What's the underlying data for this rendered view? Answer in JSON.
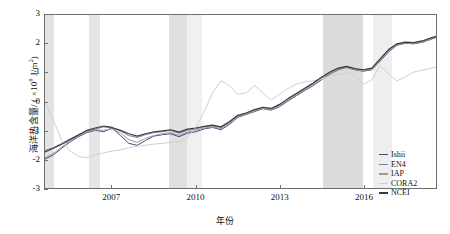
{
  "chart_data": {
    "type": "line",
    "title": "",
    "xlabel": "年份",
    "ylabel": "海洋热含量/ ( ×10⁹ J/m²)",
    "ylabel_prefix": "海洋热含量/ ( ×10",
    "ylabel_exp": "9",
    "ylabel_suffix": " J/m",
    "ylabel_exp2": "2",
    "ylabel_close": ")",
    "xlim": [
      2004.6,
      2018.6
    ],
    "ylim": [
      -3,
      3
    ],
    "grid": false,
    "legend_position": "bottom-right",
    "xticks": [
      "2007",
      "2010",
      "2013",
      "2016"
    ],
    "xtick_values": [
      2007,
      2010,
      2013,
      2016
    ],
    "yticks": [
      "3",
      "2",
      "1",
      "0",
      "-1",
      "-2",
      "-3"
    ],
    "ytick_values": [
      3,
      2,
      1,
      0,
      -1,
      -2,
      -3
    ],
    "shaded_bands": [
      {
        "x0": 2004.6,
        "x1": 2004.92,
        "color": "#e3e3e3"
      },
      {
        "x0": 2006.18,
        "x1": 2006.55,
        "color": "#e6e6e6"
      },
      {
        "x0": 2009.0,
        "x1": 2009.65,
        "color": "#e0e0e0"
      },
      {
        "x0": 2009.65,
        "x1": 2010.2,
        "color": "#f0f0f0"
      },
      {
        "x0": 2014.5,
        "x1": 2015.93,
        "color": "#dcdcdc"
      },
      {
        "x0": 2016.3,
        "x1": 2016.95,
        "color": "#eeeeee"
      }
    ],
    "series": [
      {
        "name": "Ishii",
        "color": "#4a4a78",
        "width": 1.0,
        "x": [
          2004.6,
          2004.9,
          2005.2,
          2005.5,
          2005.8,
          2006.1,
          2006.4,
          2006.7,
          2007.0,
          2007.3,
          2007.6,
          2007.9,
          2008.2,
          2008.5,
          2008.8,
          2009.1,
          2009.4,
          2009.7,
          2010.0,
          2010.3,
          2010.6,
          2010.9,
          2011.2,
          2011.5,
          2011.8,
          2012.1,
          2012.4,
          2012.7,
          2013.0,
          2013.3,
          2013.6,
          2013.9,
          2014.2,
          2014.5,
          2014.8,
          2015.1,
          2015.4,
          2015.7,
          2016.0,
          2016.3,
          2016.6,
          2016.9,
          2017.2,
          2017.5,
          2017.8,
          2018.1,
          2018.4,
          2018.6
        ],
        "y": [
          -2.0,
          -1.85,
          -1.62,
          -1.4,
          -1.22,
          -1.08,
          -1.0,
          -1.05,
          -0.92,
          -1.18,
          -1.45,
          -1.52,
          -1.35,
          -1.2,
          -1.15,
          -1.12,
          -1.22,
          -1.1,
          -1.05,
          -0.95,
          -0.9,
          -0.98,
          -0.8,
          -0.55,
          -0.45,
          -0.35,
          -0.25,
          -0.3,
          -0.18,
          0.02,
          0.2,
          0.38,
          0.55,
          0.75,
          0.95,
          1.1,
          1.18,
          1.1,
          1.05,
          1.1,
          1.4,
          1.72,
          1.95,
          2.02,
          2.0,
          2.05,
          2.15,
          2.22
        ]
      },
      {
        "name": "EN4",
        "color": "#7a7aa8",
        "width": 1.0,
        "x": [
          2004.6,
          2004.9,
          2005.2,
          2005.5,
          2005.8,
          2006.1,
          2006.4,
          2006.7,
          2007.0,
          2007.3,
          2007.6,
          2007.9,
          2008.2,
          2008.5,
          2008.8,
          2009.1,
          2009.4,
          2009.7,
          2010.0,
          2010.3,
          2010.6,
          2010.9,
          2011.2,
          2011.5,
          2011.8,
          2012.1,
          2012.4,
          2012.7,
          2013.0,
          2013.3,
          2013.6,
          2013.9,
          2014.2,
          2014.5,
          2014.8,
          2015.1,
          2015.4,
          2015.7,
          2016.0,
          2016.3,
          2016.6,
          2016.9,
          2017.2,
          2017.5,
          2017.8,
          2018.1,
          2018.4,
          2018.6
        ],
        "y": [
          -1.7,
          -1.6,
          -1.45,
          -1.3,
          -1.15,
          -1.02,
          -0.95,
          -0.88,
          -0.92,
          -1.02,
          -1.18,
          -1.25,
          -1.15,
          -1.08,
          -1.05,
          -1.0,
          -1.1,
          -1.0,
          -0.95,
          -0.88,
          -0.85,
          -0.9,
          -0.72,
          -0.5,
          -0.42,
          -0.3,
          -0.22,
          -0.25,
          -0.12,
          0.08,
          0.26,
          0.44,
          0.62,
          0.82,
          1.0,
          1.14,
          1.2,
          1.12,
          1.08,
          1.14,
          1.45,
          1.78,
          1.98,
          2.05,
          2.02,
          2.08,
          2.18,
          2.25
        ]
      },
      {
        "name": "IAP",
        "color": "#9a9a9a",
        "width": 1.0,
        "x": [
          2004.6,
          2004.9,
          2005.2,
          2005.5,
          2005.8,
          2006.1,
          2006.4,
          2006.7,
          2007.0,
          2007.3,
          2007.6,
          2007.9,
          2008.2,
          2008.5,
          2008.8,
          2009.1,
          2009.4,
          2009.7,
          2010.0,
          2010.3,
          2010.6,
          2010.9,
          2011.2,
          2011.5,
          2011.8,
          2012.1,
          2012.4,
          2012.7,
          2013.0,
          2013.3,
          2013.6,
          2013.9,
          2014.2,
          2014.5,
          2014.8,
          2015.1,
          2015.4,
          2015.7,
          2016.0,
          2016.3,
          2016.6,
          2016.9,
          2017.2,
          2017.5,
          2017.8,
          2018.1,
          2018.4,
          2018.6
        ],
        "y": [
          -1.95,
          -1.8,
          -1.58,
          -1.35,
          -1.18,
          -1.05,
          -0.98,
          -1.0,
          -0.95,
          -1.1,
          -1.32,
          -1.42,
          -1.28,
          -1.18,
          -1.12,
          -1.08,
          -1.18,
          -1.06,
          -1.0,
          -0.92,
          -0.88,
          -0.94,
          -0.76,
          -0.52,
          -0.44,
          -0.32,
          -0.24,
          -0.28,
          -0.15,
          0.05,
          0.23,
          0.41,
          0.58,
          0.78,
          0.97,
          1.12,
          1.19,
          1.11,
          1.06,
          1.12,
          1.42,
          1.75,
          1.96,
          2.03,
          2.01,
          2.06,
          2.16,
          2.23
        ]
      },
      {
        "name": "CORA2",
        "color": "#cfcfcf",
        "width": 1.0,
        "x": [
          2004.6,
          2004.9,
          2005.2,
          2005.5,
          2005.8,
          2006.1,
          2006.4,
          2006.7,
          2007.0,
          2007.3,
          2007.6,
          2007.9,
          2008.2,
          2008.5,
          2008.8,
          2009.1,
          2009.4,
          2009.7,
          2010.0,
          2010.3,
          2010.6,
          2010.9,
          2011.2,
          2011.5,
          2011.8,
          2012.1,
          2012.4,
          2012.7,
          2013.0,
          2013.3,
          2013.6,
          2013.9,
          2014.2,
          2014.5,
          2014.8,
          2015.1,
          2015.4,
          2015.7,
          2016.0,
          2016.3,
          2016.6,
          2016.9,
          2017.2,
          2017.5,
          2017.8,
          2018.1,
          2018.4,
          2018.6
        ],
        "y": [
          -0.05,
          -0.65,
          -1.35,
          -1.72,
          -1.9,
          -1.95,
          -1.85,
          -1.78,
          -1.72,
          -1.68,
          -1.6,
          -1.55,
          -1.52,
          -1.48,
          -1.45,
          -1.42,
          -1.38,
          -1.25,
          -0.9,
          -0.35,
          0.3,
          0.72,
          0.55,
          0.25,
          0.3,
          0.55,
          0.3,
          0.05,
          0.25,
          0.45,
          0.6,
          0.68,
          0.72,
          0.78,
          0.88,
          0.95,
          1.0,
          0.9,
          0.6,
          0.75,
          1.25,
          0.95,
          0.72,
          0.85,
          1.02,
          1.08,
          1.15,
          1.2
        ]
      },
      {
        "name": "NCEI",
        "color": "#3c3c3c",
        "width": 1.2,
        "x": [
          2004.6,
          2004.9,
          2005.2,
          2005.5,
          2005.8,
          2006.1,
          2006.4,
          2006.7,
          2007.0,
          2007.3,
          2007.6,
          2007.9,
          2008.2,
          2008.5,
          2008.8,
          2009.1,
          2009.4,
          2009.7,
          2010.0,
          2010.3,
          2010.6,
          2010.9,
          2011.2,
          2011.5,
          2011.8,
          2012.1,
          2012.4,
          2012.7,
          2013.0,
          2013.3,
          2013.6,
          2013.9,
          2014.2,
          2014.5,
          2014.8,
          2015.1,
          2015.4,
          2015.7,
          2016.0,
          2016.3,
          2016.6,
          2016.9,
          2017.2,
          2017.5,
          2017.8,
          2018.1,
          2018.4,
          2018.6
        ],
        "y": [
          -1.75,
          -1.62,
          -1.48,
          -1.32,
          -1.16,
          -1.0,
          -0.92,
          -0.85,
          -0.9,
          -1.0,
          -1.12,
          -1.2,
          -1.12,
          -1.05,
          -1.02,
          -0.98,
          -1.06,
          -0.96,
          -0.92,
          -0.86,
          -0.82,
          -0.88,
          -0.7,
          -0.48,
          -0.4,
          -0.28,
          -0.2,
          -0.24,
          -0.1,
          0.1,
          0.28,
          0.46,
          0.64,
          0.84,
          1.02,
          1.16,
          1.22,
          1.14,
          1.1,
          1.16,
          1.48,
          1.8,
          2.0,
          2.06,
          2.04,
          2.1,
          2.2,
          2.26
        ]
      }
    ]
  },
  "legend": {
    "items": [
      {
        "label": "Ishii",
        "color": "#4a4a78"
      },
      {
        "label": "EN4",
        "color": "#7a7aa8"
      },
      {
        "label": "IAP",
        "color": "#9a9a9a"
      },
      {
        "label": "CORA2",
        "color": "#cfcfcf"
      },
      {
        "label": "NCEI",
        "color": "#3c3c3c"
      }
    ]
  },
  "axis": {
    "frame_color": "#6f6f6f",
    "text_color": "#111111"
  }
}
